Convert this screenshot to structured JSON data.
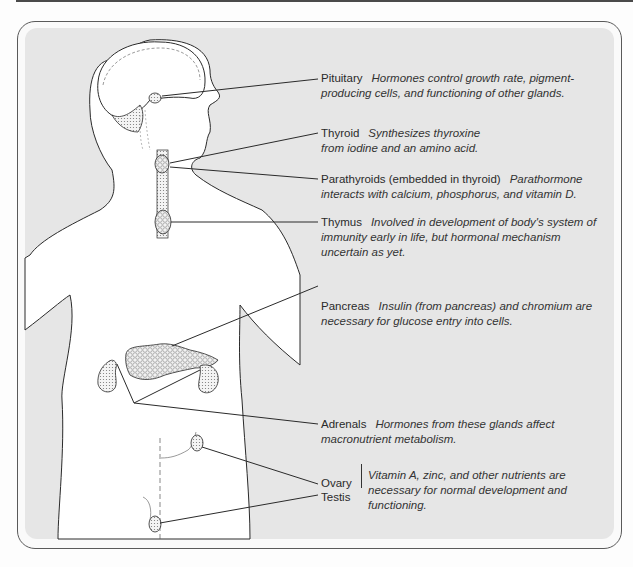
{
  "figure": {
    "colors": {
      "panel_bg": "#e6e6e6",
      "body_fill": "#ffffff",
      "line": "#2a2a2a",
      "frame": "#5a5a5a"
    }
  },
  "labels": {
    "pituitary": {
      "name": "Pituitary",
      "desc_line1": "Hormones control growth rate, pigment-",
      "desc_line2": "producing cells, and  functioning of other glands."
    },
    "thyroid": {
      "name": "Thyroid",
      "desc_line1": "Synthesizes thyroxine",
      "desc_line2": "from iodine and an amino acid."
    },
    "parathyroids": {
      "name": "Parathyroids (embedded in thyroid)",
      "desc_line1": "Parathormone",
      "desc_line2": "interacts with  calcium, phosphorus, and vitamin D."
    },
    "thymus": {
      "name": "Thymus",
      "desc_line1": "Involved in development of body's system of",
      "desc_line2": "immunity early  in life, but hormonal mechanism",
      "desc_line3": "uncertain as yet."
    },
    "pancreas": {
      "name": "Pancreas",
      "desc_line1": "Insulin (from pancreas) and chromium are",
      "desc_line2": "necessary for  glucose entry into cells."
    },
    "adrenals": {
      "name": "Adrenals",
      "desc_line1": "Hormones from these glands affect",
      "desc_line2": "macronutrient metabolism."
    },
    "gonads": {
      "name_ovary": "Ovary",
      "name_testis": "Testis",
      "desc_line1": "Vitamin A, zinc, and other nutrients are",
      "desc_line2": "necessary for  normal development and",
      "desc_line3": "functioning."
    }
  }
}
